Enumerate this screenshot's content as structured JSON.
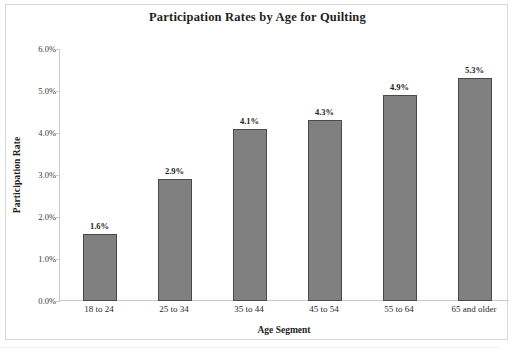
{
  "chart_data": {
    "type": "bar",
    "title": "Participation Rates by Age for Quilting",
    "xlabel": "Age Segment",
    "ylabel": "Participation Rate",
    "categories": [
      "18 to 24",
      "25 to 34",
      "35 to 44",
      "45 to 54",
      "55 to 64",
      "65 and older"
    ],
    "values": [
      1.6,
      2.9,
      4.1,
      4.3,
      4.9,
      5.3
    ],
    "value_labels": [
      "1.6%",
      "2.9%",
      "4.1%",
      "4.3%",
      "4.9%",
      "5.3%"
    ],
    "ylim": [
      0,
      6
    ],
    "ytick_values": [
      0,
      1,
      2,
      3,
      4,
      5,
      6
    ],
    "ytick_labels": [
      "0.0%",
      "1.0%",
      "2.0%",
      "3.0%",
      "4.0%",
      "5.0%",
      "6.0%"
    ],
    "grid": false,
    "legend": false,
    "bar_color": "#808080",
    "bar_border_color": "#4a4a4a",
    "axis_color": "#c9c9c9",
    "text_color": "#231f20"
  }
}
